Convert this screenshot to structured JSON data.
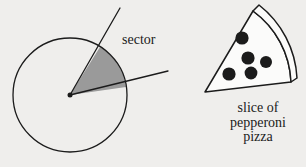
{
  "figure": {
    "background_color": "#efeeec",
    "ink_color": "#1b1b1b",
    "sector_fill_color": "#9a9a9a"
  },
  "left_diagram": {
    "name": "circle-with-sector",
    "label": "sector",
    "circle": {
      "center_x": 70,
      "center_y": 95,
      "radius": 57,
      "stroke_color": "#1b1b1b",
      "stroke_width": 1.2,
      "fill": "none"
    },
    "center_dot": {
      "x": 70,
      "y": 95,
      "radius": 2.4,
      "color": "#1b1b1b"
    },
    "sector": {
      "fill": "#9a9a9a",
      "start_angle_deg": -58,
      "end_angle_deg": -8,
      "arc_point_upper_x": 100,
      "arc_point_upper_y": 47,
      "arc_point_lower_x": 126,
      "arc_point_lower_y": 87
    },
    "radius_lines": [
      {
        "name": "upper-radius-line",
        "x1": 70,
        "y1": 95,
        "x2": 120,
        "y2": 8
      },
      {
        "name": "lower-radius-line",
        "x1": 70,
        "y1": 95,
        "x2": 168,
        "y2": 71
      }
    ]
  },
  "right_diagram": {
    "name": "pepperoni-pizza-slice",
    "caption_lines": [
      "slice of",
      "pepperoni",
      "pizza"
    ],
    "caption_full": "slice of pepperoni pizza",
    "apex_x": 205,
    "apex_y": 92,
    "top_vertex_x": 253,
    "top_vertex_y": 11,
    "bottom_vertex_x": 297,
    "bottom_vertex_y": 78,
    "crust_width": 7,
    "stroke_color": "#1b1b1b",
    "stroke_width": 1.4,
    "fill": "#fbfbfa",
    "pepperoni_color": "#1b1b1b",
    "pepperoni_count": 5,
    "pepperoni": [
      {
        "cx": 242,
        "cy": 38,
        "r": 6.6
      },
      {
        "cx": 248,
        "cy": 58,
        "r": 6.6
      },
      {
        "cx": 266,
        "cy": 62,
        "r": 6.0
      },
      {
        "cx": 251,
        "cy": 73,
        "r": 6.4
      },
      {
        "cx": 229,
        "cy": 74,
        "r": 6.6
      }
    ]
  }
}
